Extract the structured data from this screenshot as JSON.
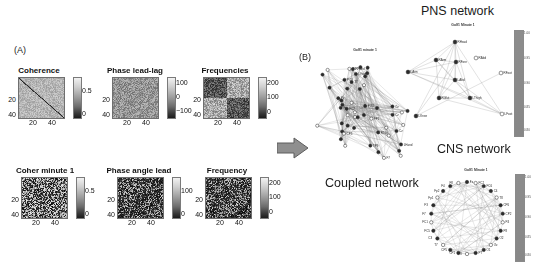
{
  "figure": {
    "panels": [
      {
        "letter": "(A)"
      },
      {
        "letter": "(B)"
      }
    ]
  },
  "panel_a": {
    "letter": "(A)",
    "heatmaps": [
      {
        "title": "Coherence",
        "y_ticks": [
          "20",
          "40"
        ],
        "x_ticks": [
          "20",
          "40"
        ],
        "colorbar": {
          "labels": [
            "0.5",
            "0"
          ]
        },
        "pattern": "diagonal"
      },
      {
        "title": "Phase lead-lag",
        "y_ticks": [
          "20",
          "40"
        ],
        "x_ticks": [
          "20",
          "40"
        ],
        "colorbar": {
          "labels": [
            "100",
            "0",
            "−100"
          ]
        },
        "pattern": "noise"
      },
      {
        "title": "Frequencies",
        "y_ticks": [
          "20",
          "40"
        ],
        "x_ticks": [
          "20",
          "40"
        ],
        "colorbar": {
          "labels": [
            "200",
            "100",
            "0"
          ]
        },
        "pattern": "blocks"
      },
      {
        "title": "Coher minute 1",
        "y_ticks": [
          "20",
          "40"
        ],
        "x_ticks": [
          "20",
          "40"
        ],
        "colorbar": {
          "labels": [
            "0.5",
            "0"
          ]
        },
        "pattern": "noise-high"
      },
      {
        "title": "Phase angle lead",
        "y_ticks": [
          "20",
          "40"
        ],
        "x_ticks": [
          "20",
          "40"
        ],
        "colorbar": {
          "labels": [
            "100",
            "0"
          ]
        },
        "pattern": "noise-dark"
      },
      {
        "title": "Frequency",
        "y_ticks": [
          "20",
          "40"
        ],
        "x_ticks": [
          "20",
          "40"
        ],
        "colorbar": {
          "labels": [
            "200",
            "100",
            "0"
          ]
        },
        "pattern": "noise-dark"
      }
    ]
  },
  "panel_b": {
    "letter": "(B)",
    "arrow": {
      "name": "flow-arrow",
      "direction": "right",
      "color": "#8d8d8d"
    },
    "networks": [
      {
        "id": "coupled",
        "heading": "Coupled network",
        "subtitle": "Golf1 minute 1",
        "layout": "dense-hairball",
        "node_labels": [
          "PO3",
          "CP1",
          "CP5",
          "FC2",
          "P7",
          "FP1",
          "O1",
          "C3",
          "Cz",
          "Pz",
          "F3",
          "F7",
          "T7",
          "FT9",
          "Oz",
          "Fz",
          "FC5",
          "TP9",
          "LFoot",
          "RFoot",
          "LHand",
          "RHand",
          "LTibi",
          "RTibi"
        ]
      },
      {
        "id": "pns",
        "heading": "PNS network",
        "subtitle": "Golf1 Minute 1",
        "layout": "sparse",
        "node_labels": [
          "RHead",
          "RArm",
          "RFore",
          "LArm",
          "LAbd",
          "RAbd",
          "RGlut",
          "LThigh",
          "LKnee",
          "LFoot",
          "RFoot"
        ]
      },
      {
        "id": "cns",
        "heading": "CNS network",
        "subtitle": "Golf1 Minute 1",
        "layout": "circular",
        "node_labels": [
          "Fz",
          "FC2",
          "FC6",
          "C4",
          "T8",
          "CP6",
          "CP2",
          "P4",
          "P8",
          "O2",
          "Oz",
          "O1",
          "P7",
          "P3",
          "CP1",
          "CP5",
          "T7",
          "C3",
          "FC5",
          "FC1",
          "F7",
          "F3",
          "Fp1",
          "Fp2",
          "F4",
          "F8"
        ]
      }
    ],
    "colorbars": [
      {
        "for": "pns",
        "ticks": [
          "1.00",
          "0.95",
          "0.90",
          "0.85",
          "0.80"
        ]
      },
      {
        "for": "cns",
        "ticks": [
          "1.00",
          "0.95",
          "0.90",
          "0.85",
          "0.80"
        ]
      }
    ]
  }
}
